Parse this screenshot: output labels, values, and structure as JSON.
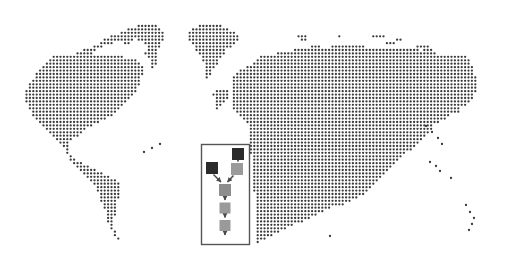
{
  "document": {
    "title": "Dotted World Map With Process Flow Overlay",
    "background_color": "#ffffff"
  },
  "map": {
    "name": "dotted-world-map",
    "style": "halftone-dot-grid",
    "dot_color": "#3a3a3a",
    "dot_diameter_px": 2.3,
    "grid_spacing_px": 3.45,
    "bounds": {
      "x": 18,
      "y": 14,
      "width": 476,
      "height": 240
    },
    "regions": [
      "north-america",
      "greenland",
      "central-america",
      "south-america",
      "europe",
      "africa",
      "asia",
      "russia",
      "middle-east",
      "india",
      "southeast-asia",
      "japan",
      "australia",
      "new-zealand"
    ]
  },
  "flowchart": {
    "name": "process-flow-diagram",
    "frame": {
      "x": 201,
      "y": 144,
      "width": 49,
      "height": 101,
      "border_color": "#555555",
      "border_width_px": 1.5,
      "fill": "#ffffff"
    },
    "colors": {
      "source_node": "#2b2b2b",
      "stage_node": "#9a9a9a",
      "mid_node": "#8d8d8d",
      "connector": "#4a4a4a"
    },
    "nodes": [
      {
        "id": "source-right",
        "label": "",
        "x": 232,
        "y": 148,
        "w": 12,
        "h": 12,
        "shade": "dark"
      },
      {
        "id": "source-left",
        "label": "",
        "x": 206,
        "y": 162,
        "w": 12,
        "h": 12,
        "shade": "dark"
      },
      {
        "id": "stage-right",
        "label": "",
        "x": 231,
        "y": 163,
        "w": 12,
        "h": 12,
        "shade": "gray"
      },
      {
        "id": "merge",
        "label": "",
        "x": 219,
        "y": 184,
        "w": 12,
        "h": 12,
        "shade": "gray"
      },
      {
        "id": "step-2",
        "label": "",
        "x": 219,
        "y": 203,
        "w": 11,
        "h": 11,
        "shade": "gray"
      },
      {
        "id": "step-3",
        "label": "",
        "x": 219,
        "y": 220,
        "w": 11,
        "h": 11,
        "shade": "gray"
      }
    ],
    "connectors": [
      {
        "from": "source-right",
        "to": "stage-right",
        "type": "arrow-down"
      },
      {
        "from": "stage-right",
        "to": "merge",
        "type": "arrow-diagonal-left"
      },
      {
        "from": "source-left",
        "to": "merge",
        "type": "arrow-diagonal-right"
      },
      {
        "from": "merge",
        "to": "step-2",
        "type": "arrow-down"
      },
      {
        "from": "step-2",
        "to": "step-3",
        "type": "arrow-down"
      },
      {
        "from": "step-3",
        "to": "terminus",
        "type": "arrow-down"
      }
    ]
  }
}
